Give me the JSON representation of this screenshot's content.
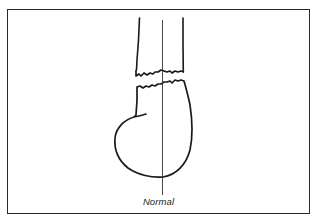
{
  "figure": {
    "caption": "Normal",
    "colors": {
      "ink": "#1a1a1a",
      "axis_line": "#333333",
      "frame": "#2a2a2a",
      "background": "#ffffff"
    }
  }
}
